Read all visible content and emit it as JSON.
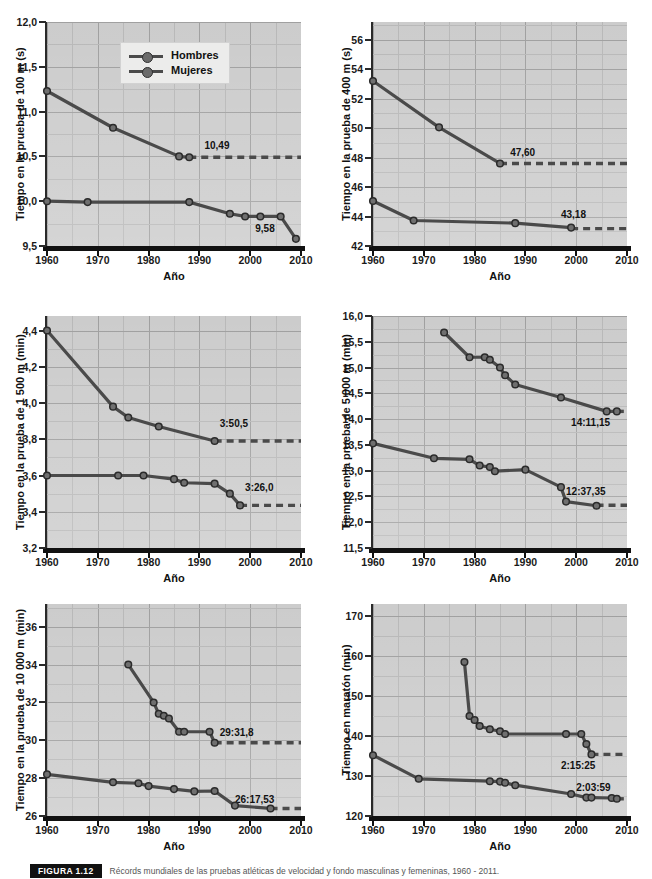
{
  "figure": {
    "caption_tag": "FIGURA 1.12",
    "caption_text": "Récords mundiales de las pruebas atléticas de velocidad y fondo masculinas y femeninas, 1960 - 2011."
  },
  "legend": {
    "position": "top-center of first panel",
    "entries": [
      {
        "label": "Hombres",
        "color": "#4a4a4a"
      },
      {
        "label": "Mujeres",
        "color": "#4a4a4a"
      }
    ]
  },
  "axis": {
    "xlabel": "Año",
    "xlim": [
      1960,
      2010
    ],
    "xticks": [
      1960,
      1970,
      1980,
      1990,
      2000,
      2010
    ]
  },
  "chart_data": [
    {
      "id": "c100m",
      "type": "line",
      "title": "",
      "ylabel": "Tiempo en la prueba de 100 m (s)",
      "xlabel": "Año",
      "ylim": [
        9.5,
        12.0
      ],
      "yticks": [
        9.5,
        10.0,
        10.5,
        11.0,
        11.5,
        12.0
      ],
      "ytick_labels": [
        "9,5",
        "10,0",
        "10,5",
        "11,0",
        "11,5",
        "12,0"
      ],
      "xlim": [
        1960,
        2010
      ],
      "xticks": [
        1960,
        1970,
        1980,
        1990,
        2000,
        2010
      ],
      "xtick_labels": [
        "1960",
        "1970",
        "1980",
        "1990",
        "2000",
        "2010"
      ],
      "grid": true,
      "series": [
        {
          "name": "Mujeres",
          "x": [
            1960,
            1973,
            1986,
            1988
          ],
          "y": [
            11.23,
            10.82,
            10.5,
            10.49
          ],
          "dashed_from": 1988,
          "dashed_to": 2010,
          "dashed_level": 10.49,
          "annotation": {
            "text": "10,49",
            "x": 1991,
            "y": 10.62
          }
        },
        {
          "name": "Hombres",
          "x": [
            1960,
            1968,
            1988,
            1996,
            1999,
            2002,
            2006,
            2009
          ],
          "y": [
            10.0,
            9.99,
            9.99,
            9.86,
            9.83,
            9.83,
            9.83,
            9.58
          ],
          "annotation": {
            "text": "9,58",
            "x": 2001,
            "y": 9.69
          }
        }
      ]
    },
    {
      "id": "c400m",
      "type": "line",
      "title": "",
      "ylabel": "Tiempo en la prueba de 400 m (s)",
      "xlabel": "Año",
      "ylim": [
        42,
        57.2
      ],
      "yticks": [
        42,
        44,
        46,
        48,
        50,
        52,
        54,
        56
      ],
      "ytick_labels": [
        "42",
        "44",
        "46",
        "48",
        "50",
        "52",
        "54",
        "56"
      ],
      "xlim": [
        1960,
        2010
      ],
      "xticks": [
        1960,
        1970,
        1980,
        1990,
        2000,
        2010
      ],
      "xtick_labels": [
        "1960",
        "1970",
        "1980",
        "1990",
        "2000",
        "2010"
      ],
      "grid": true,
      "series": [
        {
          "name": "Mujeres",
          "x": [
            1960,
            1973,
            1985
          ],
          "y": [
            53.2,
            50.05,
            47.6
          ],
          "dashed_from": 1985,
          "dashed_to": 2010,
          "dashed_level": 47.6,
          "annotation": {
            "text": "47,60",
            "x": 1987,
            "y": 48.3
          }
        },
        {
          "name": "Hombres",
          "x": [
            1960,
            1968,
            1988,
            1999
          ],
          "y": [
            45.05,
            43.73,
            43.55,
            43.25
          ],
          "dashed_from": 1999,
          "dashed_to": 2010,
          "dashed_level": 43.18,
          "annotation": {
            "text": "43,18",
            "x": 1997,
            "y": 44.1
          }
        }
      ]
    },
    {
      "id": "c1500m",
      "type": "line",
      "title": "",
      "ylabel": "Tiempo en la prueba de 1 500 m  (min)",
      "xlabel": "Año",
      "ylim": [
        3.2,
        4.48
      ],
      "yticks": [
        3.2,
        3.4,
        3.6,
        3.8,
        4.0,
        4.2,
        4.4
      ],
      "ytick_labels": [
        "3,2",
        "3,4",
        "3,6",
        "3,8",
        "4,0",
        "4,2",
        "4,4"
      ],
      "xlim": [
        1960,
        2010
      ],
      "xticks": [
        1960,
        1970,
        1980,
        1990,
        2000,
        2010
      ],
      "xtick_labels": [
        "1960",
        "1970",
        "1980",
        "1990",
        "2000",
        "2010"
      ],
      "grid": true,
      "series": [
        {
          "name": "Mujeres",
          "x": [
            1960,
            1973,
            1976,
            1982,
            1993
          ],
          "y": [
            4.4,
            3.98,
            3.92,
            3.87,
            3.79
          ],
          "dashed_from": 1993,
          "dashed_to": 2010,
          "dashed_level": 3.79,
          "annotation": {
            "text": "3:50,5",
            "x": 1994,
            "y": 3.885
          }
        },
        {
          "name": "Hombres",
          "x": [
            1960,
            1974,
            1979,
            1985,
            1987,
            1993,
            1996,
            1998
          ],
          "y": [
            3.6,
            3.6,
            3.6,
            3.58,
            3.56,
            3.555,
            3.5,
            3.435
          ],
          "dashed_from": 1998,
          "dashed_to": 2010,
          "dashed_level": 3.435,
          "annotation": {
            "text": "3:26,0",
            "x": 1999,
            "y": 3.53
          }
        }
      ]
    },
    {
      "id": "c5000m",
      "type": "line",
      "title": "",
      "ylabel": "Tiempo en la prueba de 5 000 m (min)",
      "xlabel": "Año",
      "ylim": [
        11.5,
        16.0
      ],
      "yticks": [
        11.5,
        12.0,
        12.5,
        13.0,
        13.5,
        14.0,
        14.5,
        15.0,
        15.5,
        16.0
      ],
      "ytick_labels": [
        "11,5",
        "12,0",
        "12,5",
        "13,0",
        "13,5",
        "14,0",
        "14,5",
        "15,0",
        "15,5",
        "16,0"
      ],
      "xlim": [
        1960,
        2010
      ],
      "xticks": [
        1960,
        1970,
        1980,
        1990,
        2000,
        2010
      ],
      "xtick_labels": [
        "1960",
        "1970",
        "1980",
        "1990",
        "2000",
        "2010"
      ],
      "grid": true,
      "series": [
        {
          "name": "Mujeres",
          "x": [
            1974,
            1979,
            1982,
            1983,
            1985,
            1986,
            1988,
            1997,
            2006,
            2008
          ],
          "y": [
            15.68,
            15.2,
            15.2,
            15.15,
            15.0,
            14.85,
            14.67,
            14.42,
            14.15,
            14.15
          ],
          "dashed_from": 2008,
          "dashed_to": 2010,
          "dashed_level": 14.15,
          "annotation": {
            "text": "14:11,15",
            "x": 1999,
            "y": 13.93
          }
        },
        {
          "name": "Hombres",
          "x": [
            1960,
            1972,
            1979,
            1981,
            1983,
            1984,
            1990,
            1997,
            1998,
            2004
          ],
          "y": [
            13.53,
            13.24,
            13.22,
            13.1,
            13.07,
            12.99,
            13.02,
            12.68,
            12.4,
            12.32
          ],
          "dashed_from": 2004,
          "dashed_to": 2010,
          "dashed_level": 12.33,
          "annotation": {
            "text": "12:37,35",
            "x": 1998,
            "y": 12.59
          }
        }
      ]
    },
    {
      "id": "c10000m",
      "type": "line",
      "title": "",
      "ylabel": "Tiempo en la prueba de 10 000 m  (min)",
      "xlabel": "Año",
      "ylim": [
        26,
        37.2
      ],
      "yticks": [
        26,
        28,
        30,
        32,
        34,
        36
      ],
      "ytick_labels": [
        "26",
        "28",
        "30",
        "32",
        "34",
        "36"
      ],
      "xlim": [
        1960,
        2010
      ],
      "xticks": [
        1960,
        1970,
        1980,
        1990,
        2000,
        2010
      ],
      "xtick_labels": [
        "1960",
        "1970",
        "1980",
        "1990",
        "2000",
        "2010"
      ],
      "grid": true,
      "series": [
        {
          "name": "Mujeres",
          "x": [
            1976,
            1981,
            1982,
            1983,
            1984,
            1986,
            1987,
            1992,
            1993
          ],
          "y": [
            34.0,
            32.0,
            31.4,
            31.3,
            31.15,
            30.45,
            30.45,
            30.45,
            29.87
          ],
          "dashed_from": 1993,
          "dashed_to": 2010,
          "dashed_level": 29.87,
          "annotation": {
            "text": "29:31,8",
            "x": 1994,
            "y": 30.4
          }
        },
        {
          "name": "Hombres",
          "x": [
            1960,
            1973,
            1978,
            1980,
            1985,
            1989,
            1993,
            1997,
            2004
          ],
          "y": [
            28.2,
            27.78,
            27.73,
            27.58,
            27.42,
            27.3,
            27.32,
            26.55,
            26.4
          ],
          "dashed_from": 2004,
          "dashed_to": 2010,
          "dashed_level": 26.4,
          "annotation": {
            "text": "26:17,53",
            "x": 1997,
            "y": 26.85
          }
        }
      ]
    },
    {
      "id": "cmaraton",
      "type": "line",
      "title": "",
      "ylabel": "Tiempo en maratón (min)",
      "xlabel": "Año",
      "ylim": [
        120,
        173
      ],
      "yticks": [
        120,
        130,
        140,
        150,
        160,
        170
      ],
      "ytick_labels": [
        "120",
        "130",
        "140",
        "150",
        "160",
        "170"
      ],
      "xlim": [
        1960,
        2010
      ],
      "xticks": [
        1960,
        1970,
        1980,
        1990,
        2000,
        2010
      ],
      "xtick_labels": [
        "1960",
        "1970",
        "1980",
        "1990",
        "2000",
        "2010"
      ],
      "grid": true,
      "series": [
        {
          "name": "Mujeres",
          "x": [
            1978,
            1979,
            1980,
            1981,
            1983,
            1985,
            1986,
            1998,
            2001,
            2002,
            2003
          ],
          "y": [
            158.5,
            145.0,
            144.0,
            142.5,
            141.7,
            141.2,
            140.5,
            140.5,
            140.5,
            138.0,
            135.4
          ],
          "dashed_from": 2003,
          "dashed_to": 2010,
          "dashed_level": 135.4,
          "annotation": {
            "text": "2:15:25",
            "x": 1997,
            "y": 132.5
          }
        },
        {
          "name": "Hombres",
          "x": [
            1960,
            1969,
            1983,
            1985,
            1986,
            1988,
            1999,
            2002,
            2003,
            2007,
            2008
          ],
          "y": [
            135.2,
            129.3,
            128.7,
            128.6,
            128.3,
            127.7,
            125.5,
            124.6,
            124.6,
            124.5,
            124.3
          ],
          "dashed_from": 2008,
          "dashed_to": 2010,
          "dashed_level": 124.3,
          "annotation": {
            "text": "2:03:59",
            "x": 2000,
            "y": 126.9
          }
        }
      ]
    }
  ]
}
